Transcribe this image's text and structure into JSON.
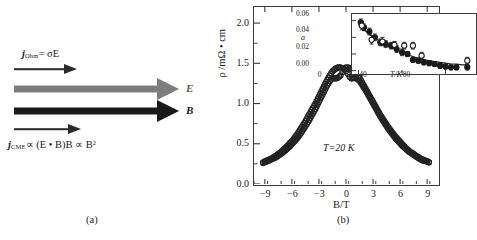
{
  "figure": {
    "panel_a": {
      "caption": "(a)",
      "equation_top": {
        "symbol": "j",
        "subscript": "Ohm",
        "rest": "= σE"
      },
      "equation_bottom": {
        "symbol": "j",
        "subscript": "CME",
        "rest": "∝ (E • B)B ∝ B",
        "exponent": "2"
      },
      "arrow_e_label": "E",
      "arrow_b_label": "B",
      "colors": {
        "e_arrow": "#7d7d7d",
        "b_arrow": "#1a1a1a",
        "thin_arrow": "#2b2b2b"
      }
    },
    "panel_b": {
      "caption": "(b)",
      "annotation": "T=20 K"
    }
  },
  "chart_data": [
    {
      "id": "main",
      "type": "line",
      "title": "",
      "xlabel": "B/T",
      "ylabel": "ρ /mΩ • cm",
      "xlim": [
        -10.2,
        10.2
      ],
      "ylim": [
        0.0,
        2.2
      ],
      "xticks": [
        -9,
        -6,
        -3,
        0,
        3,
        6,
        9
      ],
      "xtick_labels": [
        "−9",
        "−6",
        "−3",
        "0",
        "3",
        "6",
        "9"
      ],
      "yticks": [
        0.0,
        0.5,
        1.0,
        1.5,
        2.0
      ],
      "ytick_labels": [
        "0.0",
        "0.5",
        "1.0",
        "1.5",
        "2.0"
      ],
      "grid": false,
      "legend": "none",
      "marker": "open-circle",
      "series": [
        {
          "name": "sweep-up",
          "x": [
            -9.2,
            -9.0,
            -8.6,
            -8.2,
            -7.8,
            -7.4,
            -7.0,
            -6.6,
            -6.2,
            -5.8,
            -5.4,
            -5.0,
            -4.6,
            -4.2,
            -3.8,
            -3.4,
            -3.0,
            -2.6,
            -2.2,
            -1.8,
            -1.5,
            -1.2,
            -0.9,
            -0.6,
            -0.4,
            -0.2,
            0.0,
            0.2,
            0.4,
            0.6,
            0.9,
            1.2,
            1.5,
            1.8,
            2.2,
            2.6,
            3.0,
            3.4,
            3.8,
            4.2,
            4.6,
            5.0,
            5.4,
            5.8,
            6.2,
            6.6,
            7.0,
            7.4,
            7.8,
            8.2,
            8.6,
            9.0,
            9.2
          ],
          "y": [
            0.27,
            0.28,
            0.3,
            0.32,
            0.35,
            0.38,
            0.42,
            0.46,
            0.51,
            0.56,
            0.62,
            0.69,
            0.76,
            0.84,
            0.92,
            1.0,
            1.09,
            1.18,
            1.27,
            1.35,
            1.4,
            1.43,
            1.45,
            1.45,
            1.44,
            1.42,
            1.4,
            1.37,
            1.33,
            1.31,
            1.32,
            1.31,
            1.28,
            1.23,
            1.16,
            1.08,
            1.0,
            0.92,
            0.84,
            0.77,
            0.7,
            0.64,
            0.58,
            0.53,
            0.48,
            0.44,
            0.4,
            0.37,
            0.34,
            0.31,
            0.29,
            0.28,
            0.27
          ]
        },
        {
          "name": "sweep-down",
          "x": [
            -9.2,
            -9.0,
            -8.6,
            -8.2,
            -7.8,
            -7.4,
            -7.0,
            -6.6,
            -6.2,
            -5.8,
            -5.4,
            -5.0,
            -4.6,
            -4.2,
            -3.8,
            -3.4,
            -3.0,
            -2.6,
            -2.2,
            -1.8,
            -1.5,
            -1.2,
            -0.9,
            -0.6,
            -0.4,
            -0.2,
            0.0,
            0.2,
            0.4,
            0.6,
            0.9,
            1.2,
            1.5,
            1.8,
            2.2,
            2.6,
            3.0,
            3.4,
            3.8,
            4.2,
            4.6,
            5.0,
            5.4,
            5.8,
            6.2,
            6.6,
            7.0,
            7.4,
            7.8,
            8.2,
            8.6,
            9.0,
            9.2
          ],
          "y": [
            0.26,
            0.27,
            0.29,
            0.31,
            0.33,
            0.36,
            0.39,
            0.43,
            0.47,
            0.52,
            0.57,
            0.63,
            0.7,
            0.77,
            0.85,
            0.93,
            1.02,
            1.11,
            1.2,
            1.28,
            1.32,
            1.31,
            1.32,
            1.35,
            1.39,
            1.43,
            1.45,
            1.45,
            1.44,
            1.43,
            1.41,
            1.37,
            1.32,
            1.26,
            1.18,
            1.1,
            1.02,
            0.94,
            0.86,
            0.79,
            0.72,
            0.66,
            0.6,
            0.55,
            0.5,
            0.45,
            0.41,
            0.38,
            0.35,
            0.32,
            0.3,
            0.28,
            0.27
          ]
        }
      ]
    },
    {
      "id": "inset",
      "type": "scatter",
      "title": "",
      "xlabel": "T/K",
      "ylabel": "a",
      "xlim": [
        -6,
        108
      ],
      "ylim": [
        -0.004,
        0.068
      ],
      "xticks": [
        0,
        40,
        80
      ],
      "xtick_labels": [
        "0",
        "40",
        "80"
      ],
      "yticks": [
        0.0,
        0.02,
        0.04,
        0.06
      ],
      "ytick_labels": [
        "0.00",
        "0.02",
        "0.04",
        "0.06"
      ],
      "grid": false,
      "legend": "none",
      "series": [
        {
          "name": "filled-circles",
          "marker": "filled-circle",
          "x": [
            2,
            5,
            10,
            15,
            20,
            25,
            30,
            35,
            40,
            45,
            50,
            55,
            60,
            65,
            70,
            75,
            80,
            85,
            90,
            100
          ],
          "y": [
            0.058,
            0.052,
            0.047,
            0.04,
            0.034,
            0.032,
            0.03,
            0.026,
            0.022,
            0.02,
            0.013,
            0.012,
            0.01,
            0.009,
            0.008,
            0.006,
            0.005,
            0.004,
            0.004,
            0.004
          ],
          "yerr": [
            0.004,
            0.004,
            0.004,
            0.004,
            0.004,
            0.004,
            0.004,
            0.004,
            0.004,
            0.003,
            0.003,
            0.003,
            0.003,
            0.003,
            0.003,
            0.003,
            0.003,
            0.003,
            0.003,
            0.003
          ]
        },
        {
          "name": "open-circles",
          "marker": "open-circle",
          "x": [
            3,
            12,
            22,
            33,
            42,
            50,
            58,
            100
          ],
          "y": [
            0.054,
            0.037,
            0.035,
            0.031,
            0.03,
            0.03,
            0.018,
            0.012
          ],
          "yerr": [
            0.005,
            0.005,
            0.005,
            0.004,
            0.004,
            0.004,
            0.004,
            0.004
          ]
        },
        {
          "name": "fit-curve",
          "marker": "line",
          "x": [
            0,
            5,
            10,
            15,
            20,
            25,
            30,
            35,
            40,
            45,
            50,
            55,
            60,
            65,
            70,
            75,
            80,
            85,
            90,
            95,
            100
          ],
          "y": [
            0.055,
            0.049,
            0.044,
            0.039,
            0.035,
            0.031,
            0.028,
            0.025,
            0.022,
            0.019,
            0.017,
            0.015,
            0.013,
            0.012,
            0.011,
            0.01,
            0.009,
            0.008,
            0.008,
            0.007,
            0.007
          ]
        }
      ]
    }
  ]
}
